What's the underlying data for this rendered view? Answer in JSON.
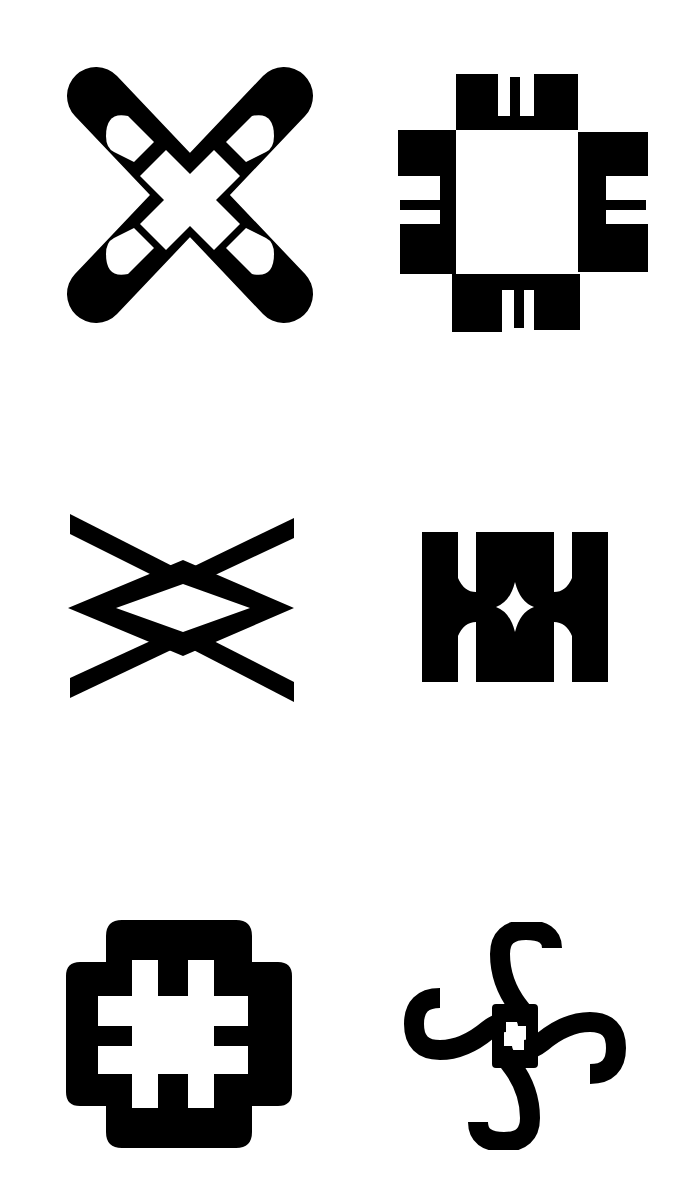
{
  "page": {
    "background": "#ffffff",
    "ink": "#000000",
    "layout": "2 columns x 3 rows grid of black pictographic symbols"
  },
  "symbols": [
    {
      "row": 1,
      "col": 1,
      "name": "cross-x-with-loops",
      "description": "Diagonal X cross with rounded arms, each arm containing a rounded cut-out"
    },
    {
      "row": 1,
      "col": 2,
      "name": "square-frame-with-comb-blocks",
      "description": "Hollow square with four stepped blocks, each with a notch and tooth"
    },
    {
      "row": 2,
      "col": 1,
      "name": "double-x-diamond",
      "description": "Two interlocking chevrons forming a diamond in the centre"
    },
    {
      "row": 2,
      "col": 2,
      "name": "double-hourglass-block",
      "description": "Block of three pillars with concave waists and a four-point star hole"
    },
    {
      "row": 3,
      "col": 1,
      "name": "hash-cross-rounded",
      "description": "Rounded stepped cross with a hash (#) shaped cut-out"
    },
    {
      "row": 3,
      "col": 2,
      "name": "four-s-spiral",
      "description": "Four S-shaped hooks radiating from a small central square"
    }
  ]
}
